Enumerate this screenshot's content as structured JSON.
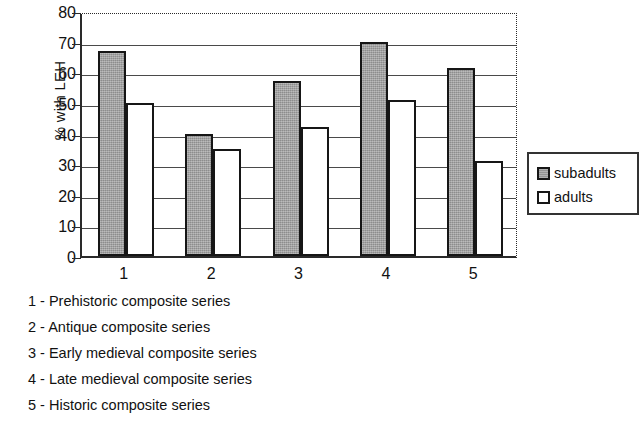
{
  "chart_data": {
    "type": "bar",
    "title": "",
    "xlabel": "",
    "ylabel": "% with LEH",
    "ylim": [
      0,
      80
    ],
    "ytick_step": 10,
    "grid": true,
    "legend_position": "right",
    "categories": [
      "1",
      "2",
      "3",
      "4",
      "5"
    ],
    "category_names": [
      "Prehistoric composite series",
      "Antique composite series",
      "Early medieval composite series",
      "Late medieval composite series",
      "Historic composite series"
    ],
    "series": [
      {
        "name": "subadults",
        "color": "#9e9e9e",
        "values": [
          67,
          40,
          57,
          70,
          61.5
        ]
      },
      {
        "name": "adults",
        "color": "#ffffff",
        "values": [
          50,
          35,
          42,
          51,
          31
        ]
      }
    ],
    "ytick_labels": [
      "80",
      "70",
      "60",
      "50",
      "40",
      "30",
      "20",
      "10",
      "0"
    ]
  },
  "legend": {
    "entries": [
      {
        "label": "subadults"
      },
      {
        "label": "adults"
      }
    ]
  },
  "caption": {
    "lines": [
      "1 - Prehistoric composite series",
      "2 - Antique composite series",
      "3 - Early medieval composite series",
      "4 - Late medieval composite series",
      "5 - Historic composite series"
    ]
  }
}
